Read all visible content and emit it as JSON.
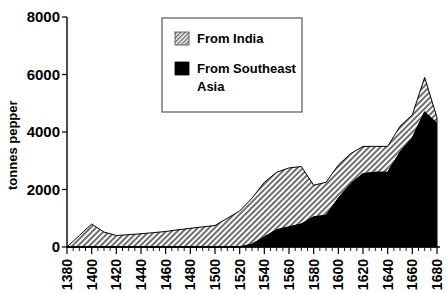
{
  "chart_data": {
    "type": "area",
    "stacked": true,
    "title": "",
    "xlabel": "",
    "ylabel": "tonnes pepper",
    "ylim": [
      0,
      8000
    ],
    "ytick_labels": [
      "0",
      "2000",
      "4000",
      "6000",
      "8000"
    ],
    "ytick_values": [
      0,
      2000,
      4000,
      6000,
      8000
    ],
    "xlim": [
      1380,
      1680
    ],
    "grid": false,
    "legend_position": "top-center",
    "categories": [
      1380,
      1390,
      1400,
      1410,
      1420,
      1430,
      1440,
      1450,
      1460,
      1470,
      1480,
      1490,
      1500,
      1510,
      1520,
      1530,
      1540,
      1550,
      1560,
      1570,
      1580,
      1590,
      1600,
      1610,
      1620,
      1630,
      1640,
      1650,
      1660,
      1670,
      1680
    ],
    "xtick_labels": [
      "1380",
      "1400",
      "1420",
      "1440",
      "1460",
      "1480",
      "1500",
      "1520",
      "1540",
      "1560",
      "1580",
      "1600",
      "1620",
      "1640",
      "1660",
      "1680"
    ],
    "xtick_values": [
      1380,
      1400,
      1420,
      1440,
      1460,
      1480,
      1500,
      1520,
      1540,
      1560,
      1580,
      1600,
      1620,
      1640,
      1660,
      1680
    ],
    "series": [
      {
        "name": "From Southeast Asia",
        "fill": "#000000",
        "pattern": "solid",
        "values": [
          0,
          0,
          0,
          0,
          0,
          0,
          0,
          0,
          0,
          0,
          0,
          0,
          0,
          0,
          0,
          100,
          350,
          600,
          700,
          800,
          1050,
          1100,
          1700,
          2200,
          2550,
          2600,
          2600,
          3300,
          3800,
          4700,
          4300
        ]
      },
      {
        "name": "From India",
        "fill": "#b0b0b0",
        "pattern": "hatched",
        "values": [
          0,
          400,
          800,
          520,
          400,
          430,
          460,
          500,
          540,
          600,
          650,
          700,
          750,
          1000,
          1250,
          1600,
          1900,
          2000,
          2050,
          2000,
          1100,
          1150,
          1150,
          1050,
          950,
          900,
          900,
          900,
          800,
          1200,
          200
        ]
      }
    ],
    "totals": [
      0,
      400,
      800,
      520,
      400,
      430,
      460,
      500,
      540,
      600,
      650,
      700,
      750,
      1000,
      1250,
      1700,
      2250,
      2600,
      2750,
      2800,
      2150,
      2250,
      2850,
      3250,
      3500,
      3500,
      3500,
      4200,
      4600,
      5900,
      4500
    ]
  },
  "legend": {
    "items": [
      {
        "label": "From India",
        "swatch": "hatched"
      },
      {
        "label": "From Southeast Asia",
        "swatch": "solid"
      }
    ],
    "line1": "From India",
    "line2a": "From Southeast",
    "line2b": "Asia"
  },
  "axes": {
    "y_title": "tonnes pepper",
    "y_0": "0",
    "y_2000": "2000",
    "y_4000": "4000",
    "y_6000": "6000",
    "y_8000": "8000",
    "x_1380": "1380",
    "x_1400": "1400",
    "x_1420": "1420",
    "x_1440": "1440",
    "x_1460": "1460",
    "x_1480": "1480",
    "x_1500": "1500",
    "x_1520": "1520",
    "x_1540": "1540",
    "x_1560": "1560",
    "x_1580": "1580",
    "x_1600": "1600",
    "x_1620": "1620",
    "x_1640": "1640",
    "x_1660": "1660",
    "x_1680": "1680"
  }
}
